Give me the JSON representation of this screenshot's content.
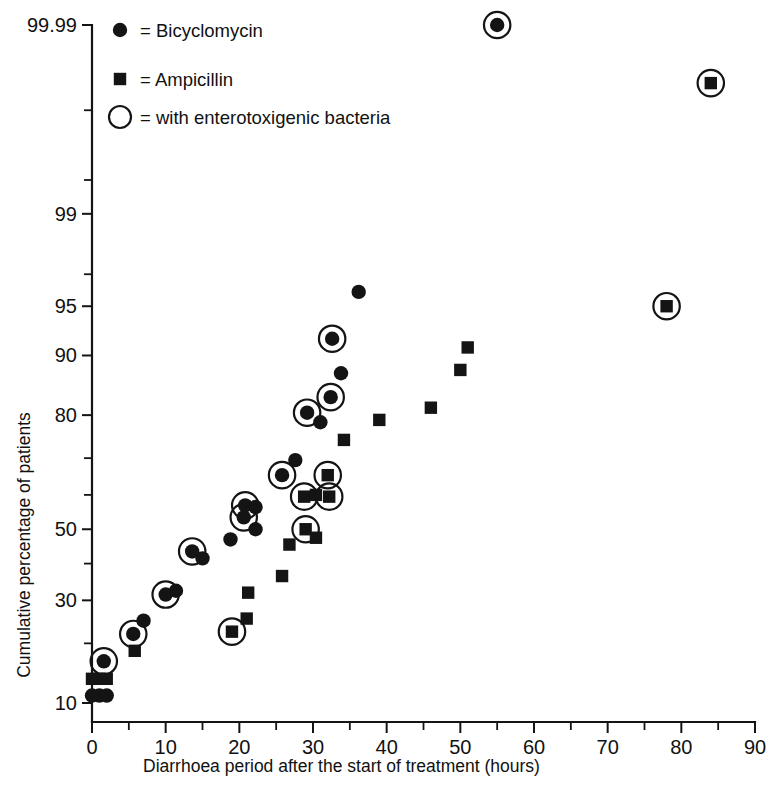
{
  "chart_data": {
    "type": "scatter",
    "title": "",
    "xlabel": "Diarrhoea period after the start of treatment (hours)",
    "ylabel": "Cumulative percentage of patients",
    "yscale": "probit",
    "xlim": [
      0,
      90
    ],
    "ylim": [
      8,
      99.99
    ],
    "grid": false,
    "legend_position": "top-left",
    "x_ticks_major": [
      0,
      10,
      20,
      30,
      40,
      50,
      60,
      70,
      80,
      90
    ],
    "x_ticks_minor": [
      5,
      15,
      25,
      35,
      45,
      55,
      65,
      75,
      85
    ],
    "y_ticks_labeled": [
      {
        "value": 99.99,
        "label": "99.99"
      },
      {
        "value": 99,
        "label": "99"
      },
      {
        "value": 95,
        "label": "95"
      },
      {
        "value": 90,
        "label": "90"
      },
      {
        "value": 80,
        "label": "80"
      },
      {
        "value": 50,
        "label": "50"
      },
      {
        "value": 30,
        "label": "30"
      },
      {
        "value": 10,
        "label": "10"
      }
    ],
    "y_ticks_unlabeled": [
      99.9,
      99.5,
      97,
      70,
      60,
      40,
      20
    ],
    "legend": [
      {
        "marker": "filled-circle",
        "equals": "=",
        "label": "Bicyclomycin"
      },
      {
        "marker": "filled-square",
        "equals": "=",
        "label": "Ampicillin"
      },
      {
        "marker": "open-circle",
        "equals": "=",
        "label": "with enterotoxigenic bacteria"
      }
    ],
    "series": [
      {
        "name": "Bicyclomycin",
        "marker": "filled-circle",
        "points": [
          {
            "x": 0.0,
            "y": 11.0,
            "ring": false
          },
          {
            "x": 1.0,
            "y": 11.0,
            "ring": false
          },
          {
            "x": 2.0,
            "y": 11.0,
            "ring": false
          },
          {
            "x": 1.6,
            "y": 16.5,
            "ring": true
          },
          {
            "x": 5.6,
            "y": 22.0,
            "ring": true
          },
          {
            "x": 7.0,
            "y": 25.0,
            "ring": false
          },
          {
            "x": 10.0,
            "y": 31.5,
            "ring": true
          },
          {
            "x": 11.4,
            "y": 32.5,
            "ring": false
          },
          {
            "x": 13.6,
            "y": 43.5,
            "ring": true
          },
          {
            "x": 15.0,
            "y": 41.5,
            "ring": false
          },
          {
            "x": 18.8,
            "y": 47.0,
            "ring": false
          },
          {
            "x": 20.8,
            "y": 57.0,
            "ring": true
          },
          {
            "x": 22.2,
            "y": 56.5,
            "ring": false
          },
          {
            "x": 20.6,
            "y": 53.5,
            "ring": true
          },
          {
            "x": 22.2,
            "y": 50.0,
            "ring": false
          },
          {
            "x": 25.8,
            "y": 65.5,
            "ring": true
          },
          {
            "x": 27.6,
            "y": 69.5,
            "ring": false
          },
          {
            "x": 29.2,
            "y": 80.5,
            "ring": true
          },
          {
            "x": 31.0,
            "y": 78.5,
            "ring": false
          },
          {
            "x": 32.4,
            "y": 83.5,
            "ring": true
          },
          {
            "x": 33.8,
            "y": 87.5,
            "ring": false
          },
          {
            "x": 32.6,
            "y": 92.0,
            "ring": true
          },
          {
            "x": 36.2,
            "y": 96.0,
            "ring": false
          },
          {
            "x": 55.0,
            "y": 99.99,
            "ring": true
          }
        ]
      },
      {
        "name": "Ampicillin",
        "marker": "filled-square",
        "points": [
          {
            "x": 0.0,
            "y": 13.5,
            "ring": false
          },
          {
            "x": 1.0,
            "y": 13.5,
            "ring": false
          },
          {
            "x": 2.0,
            "y": 13.5,
            "ring": false
          },
          {
            "x": 5.8,
            "y": 18.5,
            "ring": false
          },
          {
            "x": 19.0,
            "y": 22.5,
            "ring": true
          },
          {
            "x": 21.0,
            "y": 25.5,
            "ring": false
          },
          {
            "x": 21.2,
            "y": 32.0,
            "ring": false
          },
          {
            "x": 25.8,
            "y": 36.5,
            "ring": false
          },
          {
            "x": 26.8,
            "y": 45.5,
            "ring": false
          },
          {
            "x": 29.0,
            "y": 50.0,
            "ring": true
          },
          {
            "x": 30.4,
            "y": 47.5,
            "ring": false
          },
          {
            "x": 28.8,
            "y": 59.5,
            "ring": true
          },
          {
            "x": 30.4,
            "y": 60.0,
            "ring": false
          },
          {
            "x": 32.2,
            "y": 59.5,
            "ring": true
          },
          {
            "x": 32.0,
            "y": 65.5,
            "ring": true
          },
          {
            "x": 34.2,
            "y": 74.5,
            "ring": false
          },
          {
            "x": 39.0,
            "y": 79.0,
            "ring": false
          },
          {
            "x": 46.0,
            "y": 81.5,
            "ring": false
          },
          {
            "x": 50.0,
            "y": 88.0,
            "ring": false
          },
          {
            "x": 51.0,
            "y": 91.0,
            "ring": false
          },
          {
            "x": 78.0,
            "y": 95.0,
            "ring": true
          },
          {
            "x": 84.0,
            "y": 99.95,
            "ring": true
          }
        ]
      }
    ]
  }
}
